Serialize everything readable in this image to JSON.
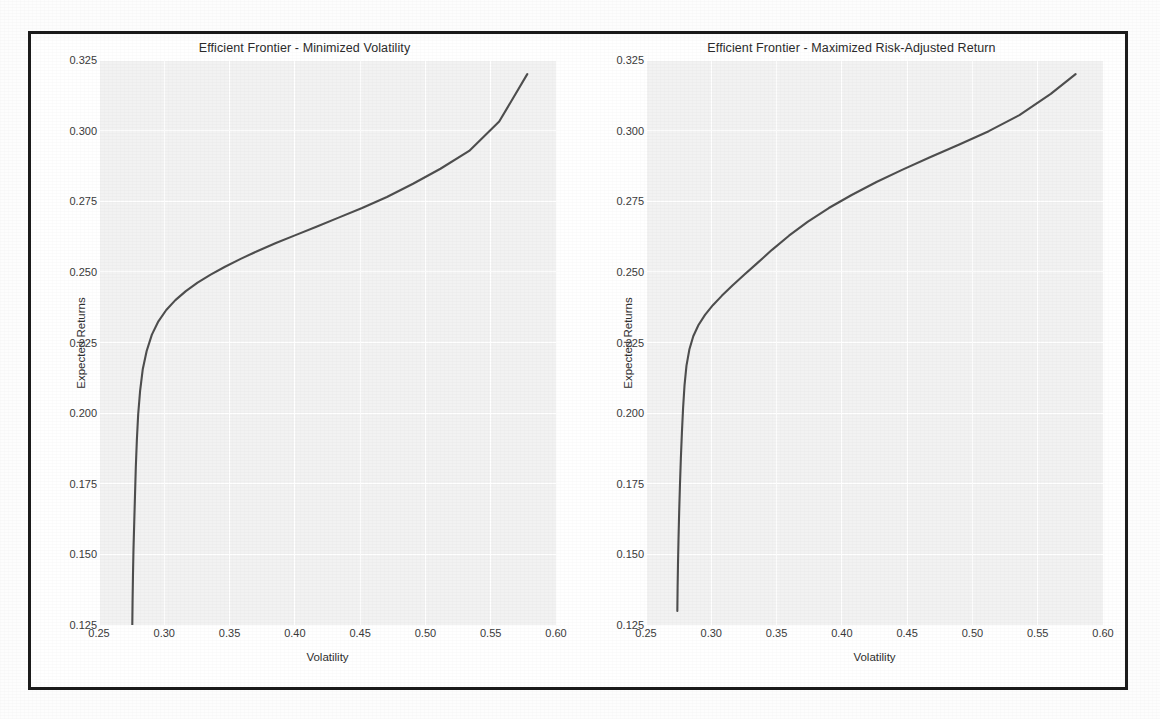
{
  "figure": {
    "background_color": "#ffffff",
    "frame_color": "#1c1c1c",
    "plot_background_color": "#f2f2f2",
    "gridline_color": "#ffffff",
    "line_color": "#4e4e4e"
  },
  "panels": [
    {
      "id": "minimized-volatility",
      "title": "Efficient Frontier - Minimized Volatility",
      "xlabel": "Volatility",
      "ylabel": "Expected Returns"
    },
    {
      "id": "maximized-risk-adjusted-return",
      "title": "Efficient Frontier - Maximized Risk-Adjusted Return",
      "xlabel": "Volatility",
      "ylabel": "Expected Returns"
    }
  ],
  "axis": {
    "xticks": [
      "0.25",
      "0.30",
      "0.35",
      "0.40",
      "0.45",
      "0.50",
      "0.55",
      "0.60"
    ],
    "xtick_values": [
      0.25,
      0.3,
      0.35,
      0.4,
      0.45,
      0.5,
      0.55,
      0.6
    ],
    "yticks": [
      "0.325",
      "0.300",
      "0.275",
      "0.250",
      "0.225",
      "0.200",
      "0.175",
      "0.150",
      "0.125"
    ],
    "ytick_values": [
      0.325,
      0.3,
      0.275,
      0.25,
      0.225,
      0.2,
      0.175,
      0.15,
      0.125
    ]
  },
  "chart_data": [
    {
      "type": "line",
      "title": "Efficient Frontier - Minimized Volatility",
      "xlabel": "Volatility",
      "ylabel": "Expected Returns",
      "xlim": [
        0.25,
        0.6
      ],
      "ylim": [
        0.125,
        0.325
      ],
      "grid": true,
      "legend": "none",
      "series": [
        {
          "name": "Efficient Frontier",
          "color": "#4e4e4e",
          "x": [
            0.2755,
            0.2757,
            0.276,
            0.2764,
            0.277,
            0.2776,
            0.2782,
            0.279,
            0.28,
            0.2815,
            0.2835,
            0.2865,
            0.2905,
            0.2955,
            0.3015,
            0.3085,
            0.3165,
            0.3255,
            0.3355,
            0.3465,
            0.3585,
            0.3715,
            0.3855,
            0.4005,
            0.4165,
            0.4335,
            0.4515,
            0.4705,
            0.4905,
            0.5115,
            0.5335,
            0.5565,
            0.578
          ],
          "y": [
            0.125,
            0.133,
            0.142,
            0.1515,
            0.1615,
            0.1715,
            0.181,
            0.1905,
            0.1995,
            0.208,
            0.2155,
            0.222,
            0.2278,
            0.2325,
            0.2365,
            0.24,
            0.2432,
            0.2462,
            0.249,
            0.2518,
            0.2546,
            0.2574,
            0.2602,
            0.263,
            0.266,
            0.2692,
            0.2726,
            0.2765,
            0.2812,
            0.2865,
            0.2928,
            0.3032,
            0.32
          ]
        }
      ]
    },
    {
      "type": "line",
      "title": "Efficient Frontier - Maximized Risk-Adjusted Return",
      "xlabel": "Volatility",
      "ylabel": "Expected Returns",
      "xlim": [
        0.25,
        0.6
      ],
      "ylim": [
        0.125,
        0.325
      ],
      "grid": true,
      "legend": "none",
      "series": [
        {
          "name": "Efficient Frontier",
          "color": "#4e4e4e",
          "x": [
            0.274,
            0.2742,
            0.2745,
            0.2749,
            0.2754,
            0.276,
            0.2767,
            0.2775,
            0.2784,
            0.2795,
            0.281,
            0.2832,
            0.2862,
            0.2902,
            0.2952,
            0.3012,
            0.3082,
            0.3162,
            0.3252,
            0.335,
            0.3465,
            0.3595,
            0.374,
            0.39,
            0.4075,
            0.4265,
            0.4465,
            0.4675,
            0.4895,
            0.5125,
            0.536,
            0.56,
            0.579
          ],
          "y": [
            0.13,
            0.138,
            0.1465,
            0.1555,
            0.165,
            0.1745,
            0.184,
            0.193,
            0.2018,
            0.2098,
            0.2168,
            0.2225,
            0.2272,
            0.2312,
            0.2348,
            0.2382,
            0.2416,
            0.2452,
            0.249,
            0.253,
            0.2578,
            0.2628,
            0.2678,
            0.2726,
            0.2772,
            0.2818,
            0.2862,
            0.2906,
            0.295,
            0.2998,
            0.3055,
            0.313,
            0.32
          ]
        }
      ]
    }
  ]
}
